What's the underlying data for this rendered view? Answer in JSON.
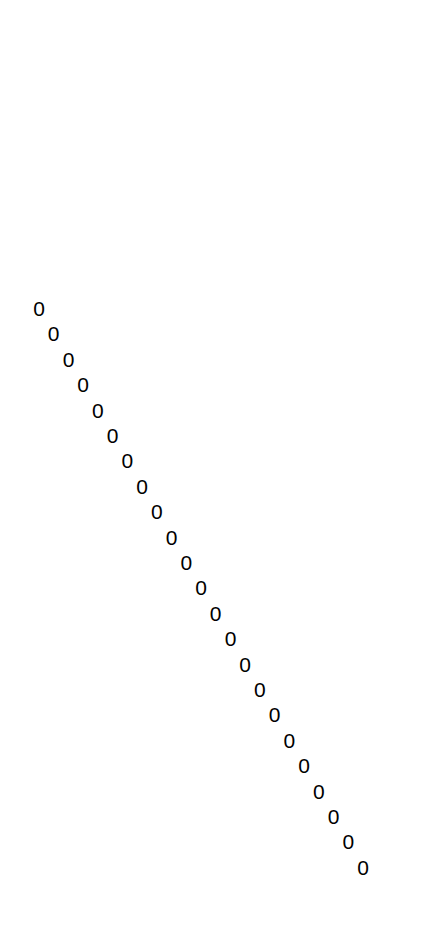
{
  "page": {
    "width": 425,
    "height": 928,
    "background_color": "#ffffff",
    "foreground_color": "#000000"
  },
  "figure": {
    "character": "0",
    "count": 23,
    "font_size_px": 21,
    "color": "#000000",
    "start": {
      "x": 39,
      "y": 308
    },
    "end": {
      "x": 363,
      "y": 867
    },
    "step": {
      "dx": 14.7,
      "dy": 25.4
    }
  },
  "chart_data": {
    "type": "scatter",
    "title": "",
    "subtitle": "",
    "xlabel": "",
    "ylabel": "",
    "xlim": [
      0,
      425
    ],
    "ylim": [
      0,
      928
    ],
    "grid": false,
    "legend": null,
    "marker": "0",
    "series": [
      {
        "name": "zeros",
        "labels": [
          "0",
          "0",
          "0",
          "0",
          "0",
          "0",
          "0",
          "0",
          "0",
          "0",
          "0",
          "0",
          "0",
          "0",
          "0",
          "0",
          "0",
          "0",
          "0",
          "0",
          "0",
          "0",
          "0"
        ],
        "x": [
          39.0,
          53.7,
          68.5,
          83.2,
          97.9,
          112.6,
          127.4,
          142.1,
          156.8,
          171.5,
          186.3,
          201.0,
          215.7,
          230.5,
          245.2,
          259.9,
          274.6,
          289.4,
          304.1,
          318.8,
          333.5,
          348.3,
          363.0
        ],
        "y": [
          308.0,
          333.4,
          358.8,
          384.2,
          409.6,
          435.0,
          460.4,
          485.8,
          511.2,
          536.6,
          562.0,
          587.4,
          612.8,
          638.2,
          663.6,
          689.0,
          714.4,
          739.8,
          765.2,
          790.6,
          816.0,
          841.4,
          866.8
        ]
      }
    ]
  }
}
